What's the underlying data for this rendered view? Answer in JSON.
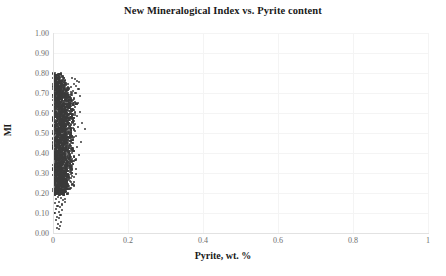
{
  "chart_data": {
    "type": "scatter",
    "title": "New Mineralogical Index vs. Pyrite content",
    "xlabel": "Pyrite, wt. %",
    "ylabel": "MI",
    "xlim": [
      0,
      1
    ],
    "ylim": [
      0,
      1
    ],
    "grid": true,
    "legend": null,
    "marker_color": "#3a3a3a",
    "marker_size": 2,
    "xticks": [
      "0",
      "0.2",
      "0.4",
      "0.6",
      "0.8",
      "1"
    ],
    "xtick_values": [
      0,
      0.2,
      0.4,
      0.6,
      0.8,
      1
    ],
    "yticks": [
      "0.00",
      "0.10",
      "0.20",
      "0.30",
      "0.40",
      "0.50",
      "0.60",
      "0.70",
      "0.80",
      "0.90",
      "1.00"
    ],
    "ytick_values": [
      0,
      0.1,
      0.2,
      0.3,
      0.4,
      0.5,
      0.6,
      0.7,
      0.8,
      0.9,
      1.0
    ],
    "points": [
      [
        0.002,
        0.795
      ],
      [
        0.004,
        0.79
      ],
      [
        0.006,
        0.788
      ],
      [
        0.003,
        0.782
      ],
      [
        0.008,
        0.779
      ],
      [
        0.005,
        0.776
      ],
      [
        0.01,
        0.773
      ],
      [
        0.002,
        0.77
      ],
      [
        0.013,
        0.768
      ],
      [
        0.007,
        0.765
      ],
      [
        0.004,
        0.762
      ],
      [
        0.016,
        0.76
      ],
      [
        0.009,
        0.757
      ],
      [
        0.003,
        0.755
      ],
      [
        0.012,
        0.752
      ],
      [
        0.006,
        0.75
      ],
      [
        0.019,
        0.748
      ],
      [
        0.002,
        0.745
      ],
      [
        0.014,
        0.743
      ],
      [
        0.008,
        0.74
      ],
      [
        0.022,
        0.738
      ],
      [
        0.005,
        0.736
      ],
      [
        0.011,
        0.733
      ],
      [
        0.017,
        0.731
      ],
      [
        0.003,
        0.729
      ],
      [
        0.025,
        0.727
      ],
      [
        0.009,
        0.724
      ],
      [
        0.013,
        0.722
      ],
      [
        0.006,
        0.72
      ],
      [
        0.02,
        0.718
      ],
      [
        0.002,
        0.715
      ],
      [
        0.028,
        0.713
      ],
      [
        0.011,
        0.711
      ],
      [
        0.016,
        0.709
      ],
      [
        0.007,
        0.706
      ],
      [
        0.023,
        0.704
      ],
      [
        0.004,
        0.702
      ],
      [
        0.031,
        0.7
      ],
      [
        0.013,
        0.698
      ],
      [
        0.018,
        0.695
      ],
      [
        0.009,
        0.693
      ],
      [
        0.026,
        0.691
      ],
      [
        0.002,
        0.689
      ],
      [
        0.034,
        0.687
      ],
      [
        0.015,
        0.684
      ],
      [
        0.02,
        0.682
      ],
      [
        0.006,
        0.68
      ],
      [
        0.029,
        0.678
      ],
      [
        0.011,
        0.676
      ],
      [
        0.037,
        0.674
      ],
      [
        0.003,
        0.671
      ],
      [
        0.017,
        0.669
      ],
      [
        0.023,
        0.667
      ],
      [
        0.008,
        0.665
      ],
      [
        0.032,
        0.663
      ],
      [
        0.013,
        0.66
      ],
      [
        0.04,
        0.658
      ],
      [
        0.005,
        0.656
      ],
      [
        0.019,
        0.654
      ],
      [
        0.026,
        0.652
      ],
      [
        0.01,
        0.65
      ],
      [
        0.035,
        0.647
      ],
      [
        0.002,
        0.645
      ],
      [
        0.015,
        0.643
      ],
      [
        0.043,
        0.641
      ],
      [
        0.021,
        0.639
      ],
      [
        0.007,
        0.637
      ],
      [
        0.029,
        0.634
      ],
      [
        0.012,
        0.632
      ],
      [
        0.038,
        0.63
      ],
      [
        0.004,
        0.628
      ],
      [
        0.017,
        0.626
      ],
      [
        0.046,
        0.624
      ],
      [
        0.024,
        0.621
      ],
      [
        0.009,
        0.619
      ],
      [
        0.032,
        0.617
      ],
      [
        0.014,
        0.615
      ],
      [
        0.041,
        0.613
      ],
      [
        0.002,
        0.611
      ],
      [
        0.019,
        0.608
      ],
      [
        0.027,
        0.606
      ],
      [
        0.011,
        0.604
      ],
      [
        0.035,
        0.602
      ],
      [
        0.006,
        0.6
      ],
      [
        0.016,
        0.597
      ],
      [
        0.044,
        0.595
      ],
      [
        0.022,
        0.593
      ],
      [
        0.008,
        0.591
      ],
      [
        0.03,
        0.589
      ],
      [
        0.013,
        0.587
      ],
      [
        0.038,
        0.584
      ],
      [
        0.003,
        0.582
      ],
      [
        0.018,
        0.58
      ],
      [
        0.025,
        0.578
      ],
      [
        0.01,
        0.576
      ],
      [
        0.033,
        0.573
      ],
      [
        0.015,
        0.571
      ],
      [
        0.041,
        0.569
      ],
      [
        0.005,
        0.567
      ],
      [
        0.02,
        0.565
      ],
      [
        0.028,
        0.563
      ],
      [
        0.011,
        0.56
      ],
      [
        0.036,
        0.558
      ],
      [
        0.002,
        0.556
      ],
      [
        0.017,
        0.554
      ],
      [
        0.023,
        0.552
      ],
      [
        0.008,
        0.55
      ],
      [
        0.031,
        0.547
      ],
      [
        0.013,
        0.545
      ],
      [
        0.039,
        0.543
      ],
      [
        0.004,
        0.541
      ],
      [
        0.019,
        0.539
      ],
      [
        0.026,
        0.536
      ],
      [
        0.01,
        0.534
      ],
      [
        0.034,
        0.532
      ],
      [
        0.015,
        0.53
      ],
      [
        0.006,
        0.528
      ],
      [
        0.022,
        0.526
      ],
      [
        0.029,
        0.523
      ],
      [
        0.012,
        0.521
      ],
      [
        0.037,
        0.519
      ],
      [
        0.002,
        0.517
      ],
      [
        0.017,
        0.515
      ],
      [
        0.024,
        0.513
      ],
      [
        0.009,
        0.51
      ],
      [
        0.032,
        0.508
      ],
      [
        0.014,
        0.506
      ],
      [
        0.005,
        0.504
      ],
      [
        0.02,
        0.502
      ],
      [
        0.027,
        0.499
      ],
      [
        0.011,
        0.497
      ],
      [
        0.035,
        0.495
      ],
      [
        0.003,
        0.493
      ],
      [
        0.016,
        0.491
      ],
      [
        0.023,
        0.489
      ],
      [
        0.008,
        0.486
      ],
      [
        0.03,
        0.484
      ],
      [
        0.013,
        0.482
      ],
      [
        0.038,
        0.48
      ],
      [
        0.006,
        0.478
      ],
      [
        0.018,
        0.475
      ],
      [
        0.025,
        0.473
      ],
      [
        0.01,
        0.471
      ],
      [
        0.033,
        0.469
      ],
      [
        0.002,
        0.467
      ],
      [
        0.015,
        0.465
      ],
      [
        0.021,
        0.462
      ],
      [
        0.007,
        0.46
      ],
      [
        0.028,
        0.458
      ],
      [
        0.012,
        0.456
      ],
      [
        0.036,
        0.454
      ],
      [
        0.004,
        0.451
      ],
      [
        0.017,
        0.449
      ],
      [
        0.024,
        0.447
      ],
      [
        0.009,
        0.445
      ],
      [
        0.031,
        0.443
      ],
      [
        0.014,
        0.441
      ],
      [
        0.005,
        0.438
      ],
      [
        0.019,
        0.436
      ],
      [
        0.026,
        0.434
      ],
      [
        0.011,
        0.432
      ],
      [
        0.034,
        0.43
      ],
      [
        0.002,
        0.427
      ],
      [
        0.016,
        0.425
      ],
      [
        0.022,
        0.423
      ],
      [
        0.008,
        0.421
      ],
      [
        0.029,
        0.419
      ],
      [
        0.013,
        0.417
      ],
      [
        0.037,
        0.414
      ],
      [
        0.006,
        0.412
      ],
      [
        0.018,
        0.41
      ],
      [
        0.025,
        0.408
      ],
      [
        0.01,
        0.406
      ],
      [
        0.032,
        0.403
      ],
      [
        0.003,
        0.401
      ],
      [
        0.015,
        0.399
      ],
      [
        0.021,
        0.397
      ],
      [
        0.007,
        0.395
      ],
      [
        0.027,
        0.393
      ],
      [
        0.012,
        0.39
      ],
      [
        0.035,
        0.388
      ],
      [
        0.004,
        0.386
      ],
      [
        0.017,
        0.384
      ],
      [
        0.023,
        0.382
      ],
      [
        0.009,
        0.379
      ],
      [
        0.03,
        0.377
      ],
      [
        0.014,
        0.375
      ],
      [
        0.005,
        0.373
      ],
      [
        0.019,
        0.371
      ],
      [
        0.026,
        0.369
      ],
      [
        0.011,
        0.366
      ],
      [
        0.033,
        0.364
      ],
      [
        0.002,
        0.362
      ],
      [
        0.016,
        0.36
      ],
      [
        0.022,
        0.358
      ],
      [
        0.008,
        0.355
      ],
      [
        0.028,
        0.353
      ],
      [
        0.013,
        0.351
      ],
      [
        0.036,
        0.349
      ],
      [
        0.006,
        0.347
      ],
      [
        0.018,
        0.345
      ],
      [
        0.024,
        0.342
      ],
      [
        0.01,
        0.34
      ],
      [
        0.031,
        0.338
      ],
      [
        0.003,
        0.336
      ],
      [
        0.015,
        0.334
      ],
      [
        0.02,
        0.331
      ],
      [
        0.007,
        0.329
      ],
      [
        0.027,
        0.327
      ],
      [
        0.012,
        0.325
      ],
      [
        0.034,
        0.323
      ],
      [
        0.004,
        0.321
      ],
      [
        0.017,
        0.318
      ],
      [
        0.023,
        0.316
      ],
      [
        0.009,
        0.314
      ],
      [
        0.029,
        0.312
      ],
      [
        0.014,
        0.31
      ],
      [
        0.005,
        0.307
      ],
      [
        0.019,
        0.305
      ],
      [
        0.025,
        0.303
      ],
      [
        0.011,
        0.301
      ],
      [
        0.032,
        0.299
      ],
      [
        0.002,
        0.297
      ],
      [
        0.016,
        0.294
      ],
      [
        0.021,
        0.292
      ],
      [
        0.008,
        0.29
      ],
      [
        0.027,
        0.288
      ],
      [
        0.013,
        0.286
      ],
      [
        0.006,
        0.283
      ],
      [
        0.018,
        0.281
      ],
      [
        0.023,
        0.279
      ],
      [
        0.01,
        0.277
      ],
      [
        0.03,
        0.275
      ],
      [
        0.003,
        0.273
      ],
      [
        0.015,
        0.27
      ],
      [
        0.02,
        0.268
      ],
      [
        0.007,
        0.266
      ],
      [
        0.025,
        0.264
      ],
      [
        0.012,
        0.262
      ],
      [
        0.004,
        0.259
      ],
      [
        0.017,
        0.257
      ],
      [
        0.022,
        0.255
      ],
      [
        0.009,
        0.253
      ],
      [
        0.028,
        0.251
      ],
      [
        0.014,
        0.249
      ],
      [
        0.005,
        0.246
      ],
      [
        0.019,
        0.244
      ],
      [
        0.024,
        0.242
      ],
      [
        0.011,
        0.24
      ],
      [
        0.002,
        0.238
      ],
      [
        0.016,
        0.235
      ],
      [
        0.021,
        0.233
      ],
      [
        0.008,
        0.231
      ],
      [
        0.026,
        0.229
      ],
      [
        0.013,
        0.227
      ],
      [
        0.006,
        0.224
      ],
      [
        0.018,
        0.222
      ],
      [
        0.01,
        0.22
      ],
      [
        0.022,
        0.218
      ],
      [
        0.003,
        0.216
      ],
      [
        0.015,
        0.213
      ],
      [
        0.019,
        0.211
      ],
      [
        0.007,
        0.209
      ],
      [
        0.012,
        0.207
      ],
      [
        0.004,
        0.205
      ],
      [
        0.017,
        0.202
      ],
      [
        0.009,
        0.2
      ],
      [
        0.014,
        0.198
      ],
      [
        0.002,
        0.196
      ],
      [
        0.011,
        0.193
      ],
      [
        0.051,
        0.775
      ],
      [
        0.058,
        0.77
      ],
      [
        0.064,
        0.762
      ],
      [
        0.07,
        0.757
      ],
      [
        0.055,
        0.745
      ],
      [
        0.062,
        0.736
      ],
      [
        0.049,
        0.728
      ],
      [
        0.068,
        0.72
      ],
      [
        0.053,
        0.712
      ],
      [
        0.06,
        0.7
      ],
      [
        0.047,
        0.69
      ],
      [
        0.073,
        0.684
      ],
      [
        0.056,
        0.672
      ],
      [
        0.05,
        0.66
      ],
      [
        0.066,
        0.652
      ],
      [
        0.045,
        0.64
      ],
      [
        0.059,
        0.63
      ],
      [
        0.052,
        0.618
      ],
      [
        0.071,
        0.606
      ],
      [
        0.048,
        0.596
      ],
      [
        0.063,
        0.585
      ],
      [
        0.044,
        0.574
      ],
      [
        0.055,
        0.562
      ],
      [
        0.078,
        0.552
      ],
      [
        0.049,
        0.541
      ],
      [
        0.067,
        0.53
      ],
      [
        0.043,
        0.519
      ],
      [
        0.058,
        0.508
      ],
      [
        0.085,
        0.52
      ],
      [
        0.047,
        0.497
      ],
      [
        0.061,
        0.486
      ],
      [
        0.042,
        0.475
      ],
      [
        0.054,
        0.464
      ],
      [
        0.074,
        0.454
      ],
      [
        0.046,
        0.443
      ],
      [
        0.065,
        0.432
      ],
      [
        0.041,
        0.421
      ],
      [
        0.057,
        0.41
      ],
      [
        0.05,
        0.399
      ],
      [
        0.069,
        0.388
      ],
      [
        0.044,
        0.377
      ],
      [
        0.06,
        0.366
      ],
      [
        0.039,
        0.355
      ],
      [
        0.053,
        0.344
      ],
      [
        0.047,
        0.333
      ],
      [
        0.062,
        0.322
      ],
      [
        0.038,
        0.311
      ],
      [
        0.051,
        0.3
      ],
      [
        0.043,
        0.289
      ],
      [
        0.056,
        0.278
      ],
      [
        0.036,
        0.267
      ],
      [
        0.048,
        0.256
      ],
      [
        0.04,
        0.245
      ],
      [
        0.03,
        0.234
      ],
      [
        0.034,
        0.223
      ],
      [
        0.026,
        0.212
      ],
      [
        0.029,
        0.201
      ],
      [
        0.014,
        0.182
      ],
      [
        0.021,
        0.176
      ],
      [
        0.009,
        0.17
      ],
      [
        0.027,
        0.163
      ],
      [
        0.016,
        0.157
      ],
      [
        0.006,
        0.15
      ],
      [
        0.023,
        0.143
      ],
      [
        0.012,
        0.136
      ],
      [
        0.019,
        0.128
      ],
      [
        0.008,
        0.12
      ],
      [
        0.025,
        0.113
      ],
      [
        0.015,
        0.105
      ],
      [
        0.004,
        0.098
      ],
      [
        0.02,
        0.09
      ],
      [
        0.011,
        0.082
      ],
      [
        0.017,
        0.073
      ],
      [
        0.007,
        0.064
      ],
      [
        0.022,
        0.055
      ],
      [
        0.013,
        0.045
      ],
      [
        0.018,
        0.035
      ],
      [
        0.01,
        0.026
      ],
      [
        0.015,
        0.018
      ],
      [
        0.028,
        0.188
      ],
      [
        0.033,
        0.172
      ],
      [
        0.031,
        0.155
      ],
      [
        0.024,
        0.138
      ]
    ]
  }
}
